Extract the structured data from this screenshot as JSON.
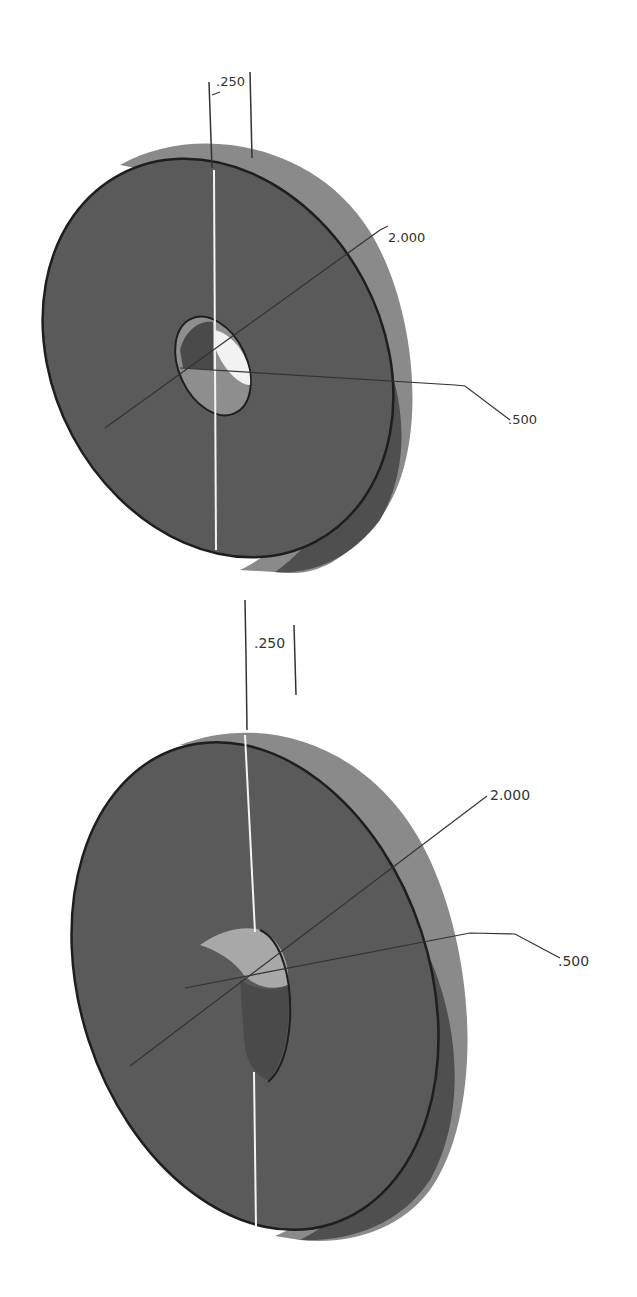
{
  "diagram": {
    "type": "cad-isometric-drawing",
    "colors": {
      "face": "#5a5a5a",
      "rim": "#8a8a8a",
      "rim_dark": "#4a4a4a",
      "hole_light": "#f2f2f2",
      "hole_mid": "#9a9a9a",
      "boss": "#a8a8a8",
      "edge": "#1e1e1e",
      "dimension_line": "#333333",
      "axis_line": "#f4f4f4"
    },
    "views": [
      {
        "id": "top-view",
        "description": "Disk with through-hole",
        "dimensions": {
          "thickness": ".250",
          "outer_diameter": "2.000",
          "hole_diameter": ".500"
        }
      },
      {
        "id": "bottom-view",
        "description": "Disk with protruding boss",
        "dimensions": {
          "thickness": ".250",
          "outer_diameter": "2.000",
          "boss_diameter": ".500"
        }
      }
    ]
  }
}
